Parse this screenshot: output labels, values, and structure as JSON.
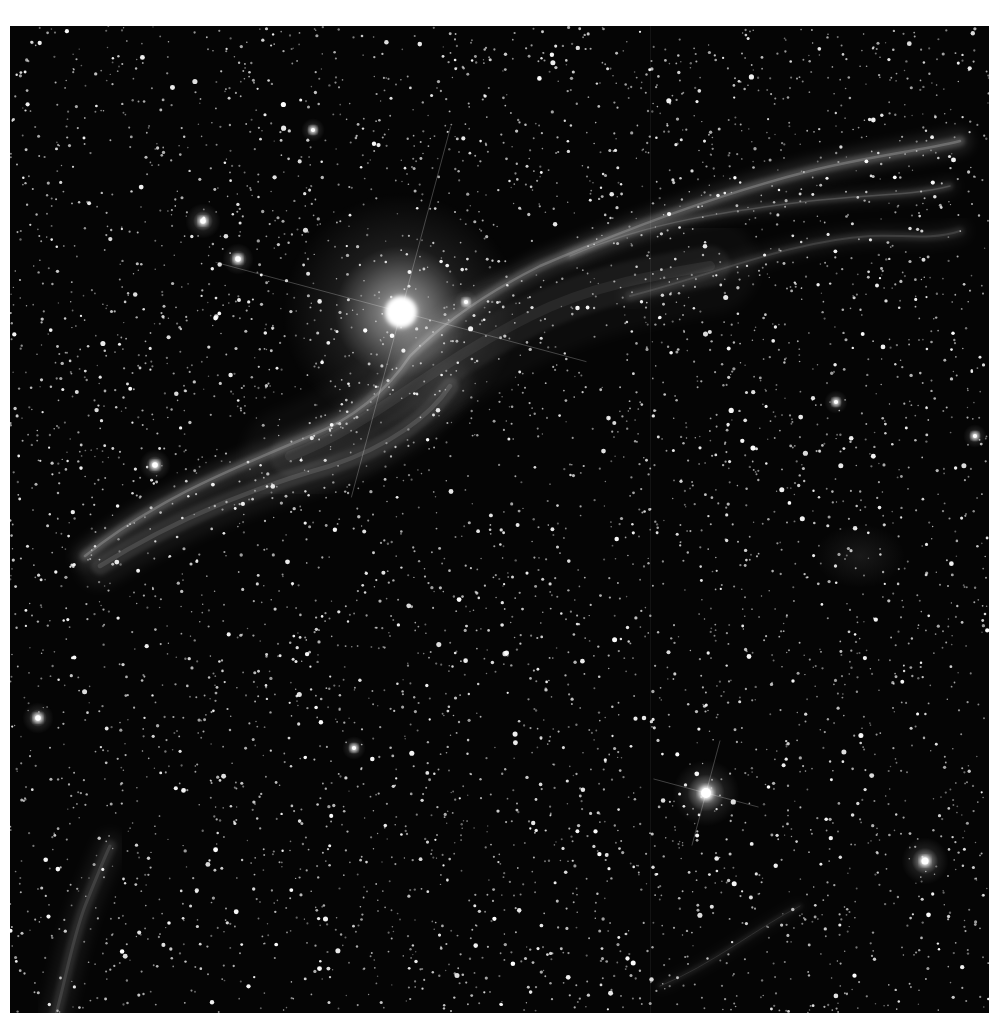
{
  "image": {
    "subject": "Western Veil Nebula (Witch's Broom) with bright star 52 Cygni",
    "palette": "grayscale",
    "colors": {
      "page_background": "#ffffff",
      "sky_background": "#050505",
      "star": "#ffffff",
      "nebula": "#bdbdbd"
    },
    "frame": {
      "x": 10,
      "y": 26,
      "width": 979,
      "height": 987
    },
    "bright_stars": [
      {
        "name": "central-bright-star",
        "x": 391,
        "y": 286,
        "radius": 16,
        "halo": 120,
        "spikes": true
      },
      {
        "name": "lower-right-bright-star",
        "x": 696,
        "y": 767,
        "radius": 7,
        "halo": 34,
        "spikes": true
      },
      {
        "name": "bottom-right-star",
        "x": 915,
        "y": 835,
        "radius": 5,
        "halo": 24,
        "spikes": false
      },
      {
        "name": "upper-left-star-1",
        "x": 193,
        "y": 195,
        "radius": 4,
        "halo": 18,
        "spikes": false
      },
      {
        "name": "upper-left-star-2",
        "x": 228,
        "y": 233,
        "radius": 4,
        "halo": 16,
        "spikes": false
      },
      {
        "name": "left-star",
        "x": 145,
        "y": 439,
        "radius": 4,
        "halo": 16,
        "spikes": false
      },
      {
        "name": "left-edge-star",
        "x": 28,
        "y": 692,
        "radius": 4,
        "halo": 16,
        "spikes": false
      },
      {
        "name": "mid-star",
        "x": 344,
        "y": 722,
        "radius": 3,
        "halo": 12,
        "spikes": false
      },
      {
        "name": "right-mid-star",
        "x": 826,
        "y": 376,
        "radius": 3,
        "halo": 12,
        "spikes": false
      },
      {
        "name": "top-star",
        "x": 303,
        "y": 104,
        "radius": 3,
        "halo": 12,
        "spikes": false
      },
      {
        "name": "upper-mid-star",
        "x": 456,
        "y": 276,
        "radius": 3,
        "halo": 12,
        "spikes": false
      },
      {
        "name": "right-star-2",
        "x": 965,
        "y": 410,
        "radius": 3,
        "halo": 12,
        "spikes": false
      }
    ],
    "nebula_filaments": [
      {
        "name": "main-filament",
        "path": "M 75 530 C 150 470, 230 440, 300 410 C 350 390, 380 360, 400 330 C 430 300, 470 270, 530 240 C 600 210, 700 170, 800 145 C 860 130, 910 125, 950 115",
        "width": 10,
        "opacity": 0.28
      },
      {
        "name": "lower-filament",
        "path": "M 90 540 C 170 490, 250 460, 320 440 C 380 420, 420 390, 440 360",
        "width": 18,
        "opacity": 0.16
      },
      {
        "name": "upper-branch",
        "path": "M 560 230 C 640 195, 720 185, 800 175 C 860 168, 900 170, 940 160",
        "width": 6,
        "opacity": 0.2
      },
      {
        "name": "right-wisps",
        "path": "M 620 270 C 700 250, 780 215, 860 210 C 890 208, 920 215, 950 205",
        "width": 8,
        "opacity": 0.14
      },
      {
        "name": "diffuse-glow",
        "path": "M 280 430 C 360 400, 420 340, 520 290 C 580 260, 640 250, 700 240",
        "width": 40,
        "opacity": 0.08
      },
      {
        "name": "bottom-left-filament",
        "path": "M 40 1010 C 55 960, 60 920, 75 880 C 85 855, 95 830, 100 820",
        "width": 12,
        "opacity": 0.14
      },
      {
        "name": "bottom-right-wisp",
        "path": "M 650 960 C 700 940, 750 900, 790 880",
        "width": 4,
        "opacity": 0.12
      }
    ],
    "faint_patches": [
      {
        "name": "right-faint-nebula",
        "x": 850,
        "y": 530,
        "rx": 45,
        "ry": 32,
        "opacity": 0.1
      }
    ],
    "seam_x": 640,
    "star_field": {
      "count": 5200,
      "seed": 52
    }
  }
}
